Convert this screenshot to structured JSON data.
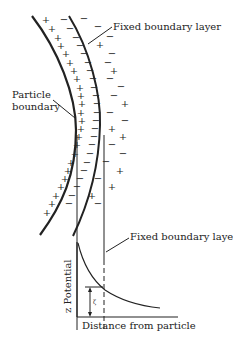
{
  "diagram": {
    "labels": {
      "fixed_boundary_top": "Fixed boundary layer",
      "particle_boundary_line1": "Particle",
      "particle_boundary_line2": "boundary",
      "fixed_boundary_bottom": "Fixed boundary layer",
      "y_axis": "z Potential",
      "x_axis": "Distance from particle",
      "zeta_marker": "ζ"
    },
    "signs": {
      "inner_layer": "+",
      "fixed_layer": "−",
      "outer_positive": "+",
      "outer_negative": "−"
    },
    "colors": {
      "ink": "#222222",
      "background": "#ffffff"
    }
  }
}
